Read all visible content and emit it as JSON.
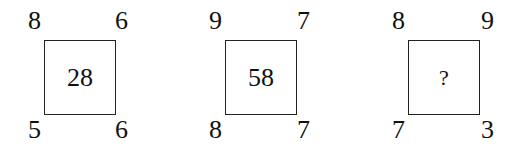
{
  "puzzle": {
    "figures": [
      {
        "top_left": "8",
        "top_right": "6",
        "bottom_left": "5",
        "bottom_right": "6",
        "center": "28"
      },
      {
        "top_left": "9",
        "top_right": "7",
        "bottom_left": "8",
        "bottom_right": "7",
        "center": "58"
      },
      {
        "top_left": "8",
        "top_right": "9",
        "bottom_left": "7",
        "bottom_right": "3",
        "center": "?"
      }
    ]
  }
}
